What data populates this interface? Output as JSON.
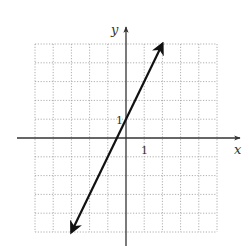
{
  "chart_data": {
    "type": "line",
    "title": "",
    "xlabel": "x",
    "ylabel": "y",
    "xlim": [
      -5,
      5
    ],
    "ylim": [
      -5,
      5
    ],
    "grid": true,
    "grid_style": "dotted",
    "tick_labels": {
      "x": [
        "1"
      ],
      "y": [
        "1"
      ]
    },
    "series": [
      {
        "name": "y = 2x + 1",
        "equation": "y = 2x + 1",
        "slope": 2,
        "y_intercept": 1,
        "x_intercept": -0.5,
        "x": [
          -3,
          2
        ],
        "y": [
          -5,
          5
        ],
        "arrows_both_ends": true
      }
    ],
    "legend": null
  },
  "labels": {
    "x_axis": "x",
    "y_axis": "y",
    "x_tick": "1",
    "y_tick": "1"
  },
  "colors": {
    "grid": "#9a9a9a",
    "axis": "#333333",
    "line": "#111111"
  }
}
